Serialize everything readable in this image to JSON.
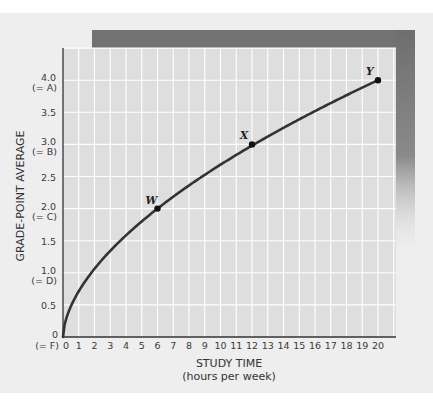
{
  "chart_data": {
    "type": "line",
    "title": "",
    "xlabel": "STUDY TIME",
    "xlabel_sub": "(hours per week)",
    "ylabel": "GRADE-POINT AVERAGE",
    "xlim": [
      0,
      20
    ],
    "ylim": [
      0,
      4.5
    ],
    "grid": true,
    "x_ticks": [
      "0",
      "1",
      "2",
      "3",
      "4",
      "5",
      "6",
      "7",
      "8",
      "9",
      "10",
      "11",
      "12",
      "13",
      "14",
      "15",
      "16",
      "17",
      "18",
      "19",
      "20"
    ],
    "y_ticks": [
      {
        "value": 0,
        "label": "0",
        "sub": "(= F)"
      },
      {
        "value": 0.5,
        "label": "0.5",
        "sub": ""
      },
      {
        "value": 1.0,
        "label": "1.0",
        "sub": "(= D)"
      },
      {
        "value": 1.5,
        "label": "1.5",
        "sub": ""
      },
      {
        "value": 2.0,
        "label": "2.0",
        "sub": "(= C)"
      },
      {
        "value": 2.5,
        "label": "2.5",
        "sub": ""
      },
      {
        "value": 3.0,
        "label": "3.0",
        "sub": "(= B)"
      },
      {
        "value": 3.5,
        "label": "3.5",
        "sub": ""
      },
      {
        "value": 4.0,
        "label": "4.0",
        "sub": "(= A)"
      }
    ],
    "series": [
      {
        "name": "GPA vs study time",
        "x": [
          0,
          1,
          2,
          3,
          4,
          5,
          6,
          7,
          8,
          9,
          10,
          11,
          12,
          13,
          14,
          15,
          16,
          17,
          18,
          19,
          20
        ],
        "values": [
          0,
          0.71,
          1.06,
          1.34,
          1.58,
          1.8,
          2.0,
          2.19,
          2.37,
          2.53,
          2.69,
          2.84,
          2.98,
          3.12,
          3.26,
          3.39,
          3.51,
          3.64,
          3.76,
          3.88,
          4.0
        ]
      }
    ],
    "points": [
      {
        "label": "W",
        "x": 6,
        "y": 2.0
      },
      {
        "label": "X",
        "x": 12,
        "y": 3.0
      },
      {
        "label": "Y",
        "x": 20,
        "y": 4.0
      }
    ],
    "colors": {
      "background": "#eeeeee",
      "plot_area": "#dedede",
      "grid": "#ffffff",
      "curve": "#333333",
      "shadow": "#707070"
    }
  }
}
